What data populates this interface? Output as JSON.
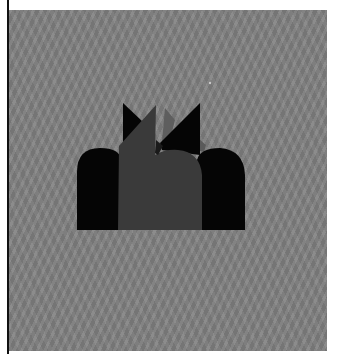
{
  "image": {
    "description": "Abstract silhouette of dark arch and spike shapes on a wavy gray textured background",
    "colors": {
      "page_background": "#ffffff",
      "canvas_background": "#808080",
      "arch_black": "#050505",
      "shard_dark_gray": "#3a3a3a",
      "shard_mid_gray": "#555555",
      "left_rule": "#111111"
    }
  }
}
